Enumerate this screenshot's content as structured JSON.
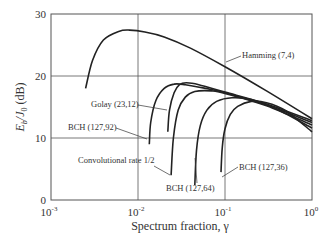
{
  "chart_data": {
    "type": "line",
    "title": "",
    "xlabel": "Spectrum fraction, γ",
    "ylabel": "E_b/J_0 (dB)",
    "xscale": "log",
    "xlim": [
      0.001,
      1
    ],
    "ylim": [
      0,
      30
    ],
    "grid": true,
    "x_ticks": [
      {
        "base": "10",
        "exp": "-3",
        "value": 0.001
      },
      {
        "base": "10",
        "exp": "-2",
        "value": 0.01
      },
      {
        "base": "10",
        "exp": "-1",
        "value": 0.1
      },
      {
        "base": "10",
        "exp": "0",
        "value": 1
      }
    ],
    "y_ticks": [
      "0",
      "10",
      "20",
      "30"
    ],
    "legend_position": "inline annotations",
    "series": [
      {
        "name": "Hamming (7,4)",
        "x": [
          0.0025,
          0.003,
          0.004,
          0.006,
          0.008,
          0.012,
          0.02,
          0.04,
          0.1,
          0.3,
          1.0
        ],
        "y": [
          18.0,
          22.5,
          25.8,
          27.2,
          27.4,
          27.1,
          26.3,
          24.5,
          21.5,
          17.6,
          13.1
        ]
      },
      {
        "name": "Golay (23,12)",
        "x": [
          0.022,
          0.023,
          0.026,
          0.03,
          0.036,
          0.05,
          0.1,
          0.3,
          1.0
        ],
        "y": [
          11.0,
          14.5,
          17.3,
          18.6,
          18.9,
          18.6,
          17.4,
          15.5,
          12.8
        ]
      },
      {
        "name": "BCH (127,92)",
        "x": [
          0.0135,
          0.014,
          0.016,
          0.02,
          0.026,
          0.035,
          0.06,
          0.1,
          0.3,
          1.0
        ],
        "y": [
          9.0,
          12.5,
          16.0,
          18.0,
          18.7,
          18.6,
          18.0,
          17.3,
          15.3,
          12.5
        ]
      },
      {
        "name": "Convolutional rate 1/2",
        "x": [
          0.024,
          0.0255,
          0.029,
          0.035,
          0.045,
          0.07,
          0.1,
          0.3,
          1.0
        ],
        "y": [
          4.0,
          10.0,
          14.5,
          16.6,
          17.5,
          17.6,
          17.2,
          15.2,
          12.1
        ]
      },
      {
        "name": "BCH (127,64)",
        "x": [
          0.045,
          0.047,
          0.052,
          0.062,
          0.08,
          0.12,
          0.2,
          0.4,
          1.0
        ],
        "y": [
          2.4,
          8.0,
          12.0,
          14.5,
          15.9,
          16.5,
          16.2,
          14.6,
          11.6
        ]
      },
      {
        "name": "BCH (127,36)",
        "x": [
          0.09,
          0.093,
          0.1,
          0.115,
          0.14,
          0.2,
          0.3,
          0.5,
          1.0
        ],
        "y": [
          4.5,
          8.5,
          11.5,
          13.8,
          15.1,
          15.9,
          15.7,
          14.4,
          11.0
        ]
      }
    ],
    "annotations": [
      {
        "text": "Hamming (7,4)",
        "series": "Hamming (7,4)"
      },
      {
        "text": "Golay (23,12)",
        "series": "Golay (23,12)"
      },
      {
        "text": "BCH (127,92)",
        "series": "BCH (127,92)"
      },
      {
        "text": "Convolutional rate 1/2",
        "series": "Convolutional rate 1/2"
      },
      {
        "text": "BCH (127,64)",
        "series": "BCH (127,64)"
      },
      {
        "text": "BCH (127,36)",
        "series": "BCH (127,36)"
      }
    ]
  },
  "labels": {
    "xlabel": "Spectrum fraction, γ",
    "ylabel_main": "E",
    "ylabel_sub1": "b",
    "ylabel_mid": "/J",
    "ylabel_sub2": "0",
    "ylabel_tail": " (dB)",
    "hamming": "Hamming (7,4)",
    "golay": "Golay (23,12)",
    "bch92": "BCH (127,92)",
    "conv": "Convolutional rate 1/2",
    "bch64": "BCH (127,64)",
    "bch36": "BCH (127,36)"
  }
}
